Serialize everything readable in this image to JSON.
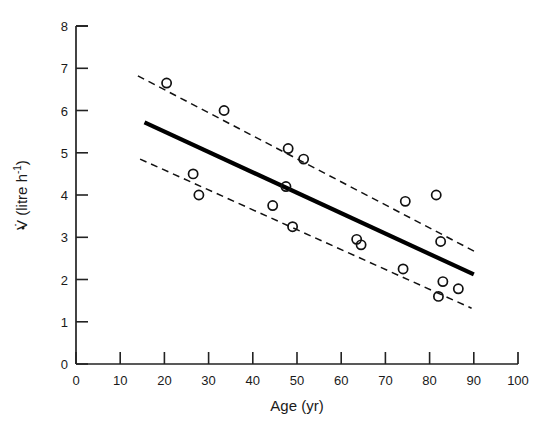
{
  "chart_data": {
    "type": "scatter",
    "title": "",
    "xlabel": "Age (yr)",
    "ylabel": "V̇ (litre h⁻¹)",
    "ylabel_main": "V̇ (litre h",
    "ylabel_sup": "-1",
    "ylabel_close": ")",
    "xlim": [
      0,
      100
    ],
    "ylim": [
      0,
      8
    ],
    "xticks": [
      0,
      10,
      20,
      30,
      40,
      50,
      60,
      70,
      80,
      90,
      100
    ],
    "yticks": [
      0,
      1,
      2,
      3,
      4,
      5,
      6,
      7,
      8
    ],
    "xtick_labels": [
      "0",
      "10",
      "20",
      "30",
      "40",
      "50",
      "60",
      "70",
      "80",
      "90",
      "100"
    ],
    "ytick_labels": [
      "0",
      "1",
      "2",
      "3",
      "4",
      "5",
      "6",
      "7",
      "8"
    ],
    "grid": false,
    "legend": false,
    "marker": "open-circle",
    "points": [
      {
        "x": 20.5,
        "y": 6.65
      },
      {
        "x": 33.5,
        "y": 6.0
      },
      {
        "x": 26.5,
        "y": 4.5
      },
      {
        "x": 27.8,
        "y": 4.0
      },
      {
        "x": 48.0,
        "y": 5.1
      },
      {
        "x": 51.5,
        "y": 4.85
      },
      {
        "x": 47.5,
        "y": 4.2
      },
      {
        "x": 44.5,
        "y": 3.75
      },
      {
        "x": 49.0,
        "y": 3.25
      },
      {
        "x": 63.5,
        "y": 2.95
      },
      {
        "x": 64.5,
        "y": 2.82
      },
      {
        "x": 74.5,
        "y": 3.85
      },
      {
        "x": 81.5,
        "y": 4.0
      },
      {
        "x": 82.5,
        "y": 2.9
      },
      {
        "x": 74.0,
        "y": 2.25
      },
      {
        "x": 83.0,
        "y": 1.95
      },
      {
        "x": 86.5,
        "y": 1.78
      },
      {
        "x": 82.0,
        "y": 1.6
      }
    ],
    "series": [
      {
        "name": "regression-line",
        "style": "solid",
        "x": [
          15.5,
          90.0
        ],
        "y": [
          5.72,
          2.12
        ]
      },
      {
        "name": "upper-confidence-limit",
        "style": "dashed",
        "x": [
          14.0,
          91.0
        ],
        "y": [
          6.82,
          2.62
        ]
      },
      {
        "name": "lower-confidence-limit",
        "style": "dashed",
        "x": [
          14.5,
          89.5
        ],
        "y": [
          4.85,
          1.32
        ]
      }
    ]
  },
  "figure": {
    "x_axis_name": "Age (yr)",
    "y_axis_name": "V (litre h-1)"
  }
}
